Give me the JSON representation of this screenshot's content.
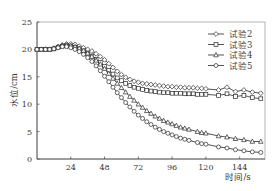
{
  "chart_data": {
    "type": "line",
    "title": "",
    "xlabel": "时间/s",
    "ylabel": "水位/cm",
    "xlim": [
      0,
      162
    ],
    "ylim": [
      0,
      25
    ],
    "xticks": [
      24,
      48,
      72,
      96,
      120,
      144
    ],
    "yticks": [
      0,
      5,
      10,
      15,
      20,
      25
    ],
    "grid": false,
    "legend_position": "upper right",
    "series": [
      {
        "name": "试验2",
        "marker": "diamond",
        "x": [
          0,
          3,
          6,
          9,
          12,
          15,
          18,
          21,
          24,
          27,
          30,
          33,
          36,
          39,
          42,
          45,
          48,
          51,
          54,
          57,
          60,
          63,
          66,
          69,
          72,
          75,
          78,
          81,
          84,
          87,
          90,
          93,
          96,
          99,
          102,
          105,
          108,
          111,
          114,
          117,
          120,
          129,
          135,
          141,
          147,
          153,
          159
        ],
        "y": [
          20,
          20,
          20,
          20,
          20.2,
          20.5,
          20.8,
          21,
          21,
          20.9,
          20.6,
          20.3,
          20,
          19.7,
          19.2,
          18.7,
          18.1,
          17.4,
          16.7,
          16,
          15.4,
          14.9,
          14.5,
          14.2,
          14,
          13.8,
          13.7,
          13.6,
          13.5,
          13.4,
          13.3,
          13.2,
          13.2,
          13.1,
          13.1,
          13,
          13,
          13,
          12.9,
          12.9,
          12.8,
          12.6,
          13.1,
          12.3,
          12.6,
          12.2,
          12
        ]
      },
      {
        "name": "试验3",
        "marker": "square",
        "x": [
          0,
          3,
          6,
          9,
          12,
          15,
          18,
          21,
          24,
          27,
          30,
          33,
          36,
          39,
          42,
          45,
          48,
          51,
          54,
          57,
          60,
          63,
          66,
          69,
          72,
          75,
          78,
          81,
          84,
          87,
          90,
          93,
          96,
          99,
          102,
          105,
          108,
          111,
          114,
          117,
          120,
          129,
          135,
          141,
          147,
          153,
          159
        ],
        "y": [
          20,
          20,
          20,
          20,
          20.1,
          20.4,
          20.6,
          20.7,
          20.6,
          20.4,
          20.1,
          19.7,
          19.3,
          18.8,
          18.2,
          17.6,
          16.9,
          16.2,
          15.5,
          14.8,
          14.3,
          13.8,
          13.4,
          13.1,
          12.9,
          12.7,
          12.5,
          12.4,
          12.3,
          12.2,
          12.1,
          12.1,
          12,
          12,
          12,
          11.9,
          11.9,
          11.9,
          11.8,
          11.8,
          11.8,
          11.6,
          11.9,
          11.4,
          11.6,
          11.2,
          11
        ]
      },
      {
        "name": "试验4",
        "marker": "triangle",
        "x": [
          0,
          3,
          6,
          9,
          12,
          15,
          18,
          21,
          24,
          27,
          30,
          33,
          36,
          39,
          42,
          45,
          48,
          51,
          54,
          57,
          60,
          63,
          66,
          69,
          72,
          75,
          78,
          81,
          84,
          87,
          90,
          93,
          96,
          99,
          102,
          105,
          108,
          114,
          117,
          120,
          129,
          135,
          141,
          147,
          153,
          159
        ],
        "y": [
          20,
          20,
          20,
          20,
          20.2,
          20.5,
          20.7,
          20.8,
          20.7,
          20.5,
          20.2,
          19.8,
          19.3,
          18.7,
          18,
          17.3,
          16.5,
          15.6,
          14.7,
          13.8,
          13,
          12.2,
          11.4,
          10.7,
          10,
          9.4,
          8.8,
          8.3,
          7.8,
          7.4,
          7,
          6.7,
          6.4,
          6.1,
          5.8,
          5.6,
          5.4,
          5,
          4.8,
          4.7,
          4.2,
          4,
          3.7,
          3.5,
          3.2,
          3.2
        ]
      },
      {
        "name": "试验5",
        "marker": "circle",
        "x": [
          0,
          3,
          6,
          9,
          12,
          15,
          18,
          21,
          24,
          27,
          30,
          33,
          36,
          39,
          42,
          45,
          48,
          51,
          54,
          57,
          60,
          63,
          66,
          69,
          72,
          75,
          78,
          81,
          84,
          87,
          90,
          93,
          96,
          99,
          102,
          105,
          108,
          114,
          117,
          120,
          129,
          135,
          141,
          147,
          153,
          159
        ],
        "y": [
          20,
          20,
          20,
          20,
          20.1,
          20.3,
          20.5,
          20.5,
          20.3,
          20,
          19.6,
          19.1,
          18.5,
          17.8,
          17,
          16.1,
          15.1,
          14.1,
          13.1,
          12.1,
          11.2,
          10.3,
          9.5,
          8.7,
          8,
          7.4,
          6.8,
          6.3,
          5.8,
          5.4,
          5,
          4.7,
          4.4,
          4.1,
          3.8,
          3.6,
          3.4,
          3,
          2.8,
          2.7,
          2.2,
          2,
          1.7,
          1.5,
          1.3,
          1.2
        ]
      }
    ]
  },
  "axes": {
    "ylabel": "水位/cm",
    "xlabel": "时间/s",
    "yticks": [
      "0",
      "5",
      "10",
      "15",
      "20",
      "25"
    ],
    "xticks": [
      "24",
      "48",
      "72",
      "96",
      "120",
      "144"
    ]
  },
  "legend": [
    {
      "label": "试验2",
      "marker": "diamond"
    },
    {
      "label": "试验3",
      "marker": "square"
    },
    {
      "label": "试验4",
      "marker": "triangle"
    },
    {
      "label": "试验5",
      "marker": "circle"
    }
  ],
  "colors": {
    "line": "#2a2a2a",
    "axis": "#555555",
    "frame": "#9a9a9a",
    "text": "#333333"
  }
}
